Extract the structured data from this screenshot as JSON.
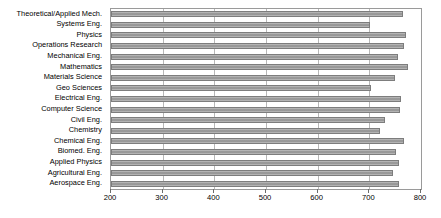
{
  "chart_data": {
    "type": "bar",
    "orientation": "horizontal",
    "title": "",
    "subtitle": "",
    "xlabel": "",
    "ylabel": "",
    "xlim": [
      200,
      800
    ],
    "ylim": null,
    "grid": true,
    "legend": null,
    "legend_position": "none",
    "xticks": [
      200,
      300,
      400,
      500,
      600,
      700,
      800
    ],
    "xtick_labels": [
      "200",
      "300",
      "400",
      "500",
      "600",
      "700",
      "800"
    ],
    "bar_baseline": 200,
    "categories": [
      "Theoretical/Applied Mech.",
      "Systems Eng.",
      "Physics",
      "Operations Research",
      "Mechanical Eng.",
      "Mathematics",
      "Materials Science",
      "Geo Sciences",
      "Electrical Eng.",
      "Computer Science",
      "Civil Eng.",
      "Chemistry",
      "Chemical Eng.",
      "Biomed. Eng.",
      "Applied Physics",
      "Agricultural Eng.",
      "Aerospace Eng."
    ],
    "values": [
      765,
      702,
      770,
      768,
      755,
      775,
      750,
      703,
      762,
      760,
      730,
      720,
      768,
      752,
      757,
      745,
      758
    ],
    "colors": {
      "bar_fill": "#a0a0a0",
      "bar_edge": "#7d7d7d",
      "gridline": "#b8b8b8",
      "plot_border": "#9a9a9a",
      "background": "#ffffff",
      "text": "#000000"
    }
  }
}
